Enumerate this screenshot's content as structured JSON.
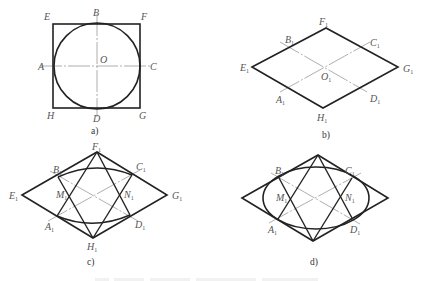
{
  "figure": {
    "panels": [
      {
        "id": "a",
        "caption": "a)",
        "description": "Square EFGH with inscribed circle centered at O, tangent at A, B, C, D; center lines AC and BD",
        "labels": {
          "A": "A",
          "B": "B",
          "C": "C",
          "D": "D",
          "E": "E",
          "F": "F",
          "G": "G",
          "H": "H",
          "O": "O"
        }
      },
      {
        "id": "b",
        "caption": "b)",
        "description": "Isometric rhombus E1F1G1H1 with center O1 and axis lines A1C1, B1D1 through side midpoints",
        "labels": {
          "A": "A",
          "B": "B",
          "C": "C",
          "D": "D",
          "E": "E",
          "F": "F",
          "G": "G",
          "H": "H",
          "O": "O"
        },
        "subscript": "1"
      },
      {
        "id": "c",
        "caption": "c)",
        "description": "Rhombus with lines F1A1, F1D1, H1B1, H1C1 intersecting at M1 and N1; large arcs B1C1 and A1D1",
        "labels": {
          "A": "A",
          "B": "B",
          "C": "C",
          "D": "D",
          "E": "E",
          "F": "F",
          "G": "G",
          "H": "H",
          "M": "M",
          "N": "N"
        },
        "subscript": "1"
      },
      {
        "id": "d",
        "caption": "d)",
        "description": "Completed approximate ellipse (four-center method) inscribed in rhombus",
        "labels": {
          "A": "A",
          "B": "B",
          "C": "C",
          "D": "D",
          "M": "M",
          "N": "N"
        },
        "subscript": "1"
      }
    ],
    "bottom_caption_note": "Figure caption text cut off at image bottom edge (unreadable)"
  },
  "colors": {
    "line": "#222222",
    "center_line": "#9a9a9a",
    "label": "#555555",
    "background": "#ffffff"
  }
}
